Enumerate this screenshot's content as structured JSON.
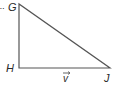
{
  "diagram": {
    "type": "right-triangle",
    "vertices": [
      {
        "label": "G",
        "x": 19,
        "y": 4
      },
      {
        "label": "H",
        "x": 19,
        "y": 68
      },
      {
        "label": "J",
        "x": 110,
        "y": 68
      }
    ],
    "prefix_mark": "..",
    "vector_label": "v",
    "line_color": "#555555"
  }
}
